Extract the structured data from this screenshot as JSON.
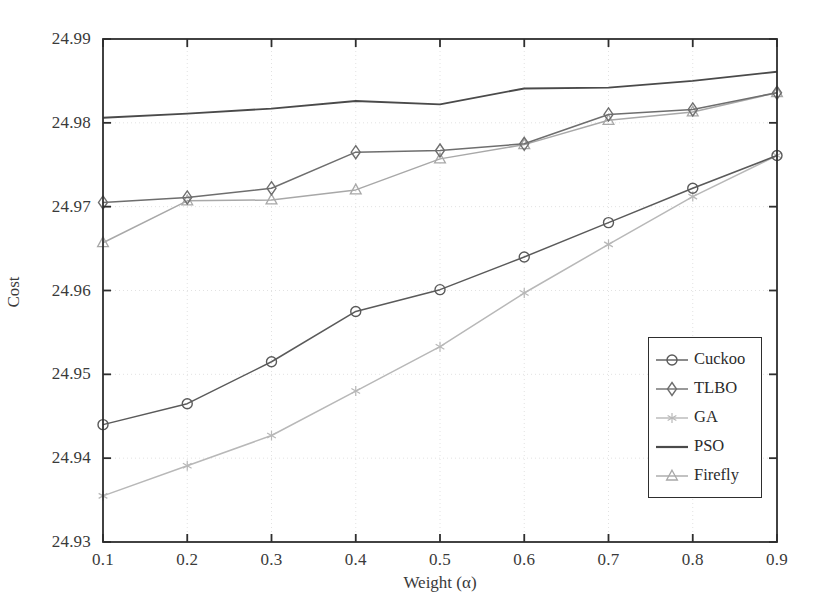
{
  "chart_data": {
    "type": "line",
    "title": "",
    "xlabel": "Weight (α)",
    "ylabel": "Cost",
    "x": [
      0.1,
      0.2,
      0.3,
      0.4,
      0.5,
      0.6,
      0.7,
      0.8,
      0.9
    ],
    "xtick_labels": [
      "0.1",
      "0.2",
      "0.3",
      "0.4",
      "0.5",
      "0.6",
      "0.7",
      "0.8",
      "0.9"
    ],
    "ytick_labels": [
      "24.93",
      "24.94",
      "24.95",
      "24.96",
      "24.97",
      "24.98",
      "24.99"
    ],
    "yticks": [
      24.93,
      24.94,
      24.95,
      24.96,
      24.97,
      24.98,
      24.99
    ],
    "xlim": [
      0.1,
      0.9
    ],
    "ylim": [
      24.93,
      24.99
    ],
    "grid": true,
    "legend_position": "lower-right",
    "series": [
      {
        "name": "Cuckoo",
        "marker": "circle",
        "color": "#5a5a5a",
        "values": [
          24.944,
          24.9465,
          24.9515,
          24.9575,
          24.9601,
          24.964,
          24.9681,
          24.9722,
          24.9761
        ]
      },
      {
        "name": "TLBO",
        "marker": "diamond",
        "color": "#6e6e6e",
        "values": [
          24.9705,
          24.9711,
          24.9722,
          24.9765,
          24.9767,
          24.9775,
          24.981,
          24.9816,
          24.9836
        ]
      },
      {
        "name": "GA",
        "marker": "asterisk",
        "color": "#b8b8b8",
        "values": [
          24.9355,
          24.9391,
          24.9427,
          24.948,
          24.9533,
          24.9597,
          24.9655,
          24.9712,
          24.9761
        ]
      },
      {
        "name": "PSO",
        "marker": "none",
        "color": "#4a4a4a",
        "values": [
          24.9806,
          24.9811,
          24.9817,
          24.9826,
          24.9822,
          24.9841,
          24.9842,
          24.985,
          24.9861
        ]
      },
      {
        "name": "Firefly",
        "marker": "triangle",
        "color": "#a8a8a8",
        "values": [
          24.9657,
          24.9707,
          24.9708,
          24.972,
          24.9757,
          24.9774,
          24.9803,
          24.9813,
          24.9836
        ]
      }
    ]
  },
  "legend": {
    "items": [
      {
        "label": "Cuckoo"
      },
      {
        "label": "TLBO"
      },
      {
        "label": "GA"
      },
      {
        "label": "PSO"
      },
      {
        "label": "Firefly"
      }
    ]
  },
  "axes": {
    "x_title": "Weight (α)",
    "y_title": "Cost"
  },
  "colors": {
    "axis": "#2e2e2e",
    "grid": "#e2e2e2",
    "background": "#ffffff"
  }
}
